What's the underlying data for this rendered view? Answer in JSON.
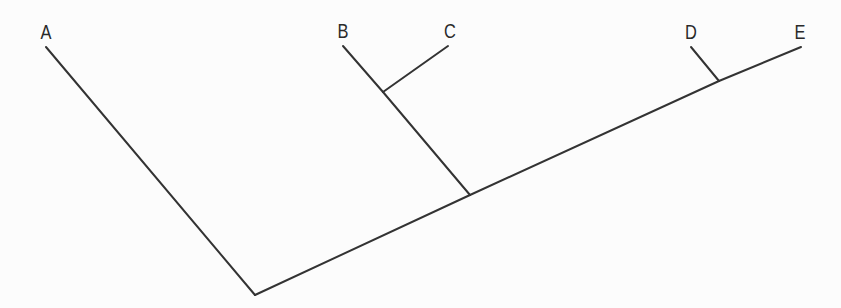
{
  "diagram": {
    "type": "cladogram",
    "line_color": "#333333",
    "background": "#fcfcfc",
    "taxa": [
      {
        "id": "A",
        "label": "A",
        "tip": [
          46,
          47
        ],
        "label_pos": [
          46,
          22
        ]
      },
      {
        "id": "B",
        "label": "B",
        "tip": [
          343,
          46
        ],
        "label_pos": [
          343,
          21
        ]
      },
      {
        "id": "C",
        "label": "C",
        "tip": [
          448,
          46
        ],
        "label_pos": [
          450,
          21
        ]
      },
      {
        "id": "D",
        "label": "D",
        "tip": [
          691,
          47
        ],
        "label_pos": [
          691,
          22
        ]
      },
      {
        "id": "E",
        "label": "E",
        "tip": [
          801,
          47
        ],
        "label_pos": [
          800,
          22
        ]
      }
    ],
    "nodes": [
      {
        "id": "root",
        "pos": [
          255,
          295
        ]
      },
      {
        "id": "BCDE",
        "pos": [
          470,
          195
        ]
      },
      {
        "id": "BC",
        "pos": [
          383,
          92
        ]
      },
      {
        "id": "DE",
        "pos": [
          719,
          81
        ]
      }
    ],
    "edges": [
      {
        "from": "root",
        "to": "A"
      },
      {
        "from": "root",
        "to": "BCDE"
      },
      {
        "from": "BCDE",
        "to": "BC"
      },
      {
        "from": "BC",
        "to": "B"
      },
      {
        "from": "BC",
        "to": "C"
      },
      {
        "from": "BCDE",
        "to": "DE"
      },
      {
        "from": "DE",
        "to": "D"
      },
      {
        "from": "DE",
        "to": "E"
      }
    ],
    "newick": "(A,((B,C),(D,E)));"
  }
}
